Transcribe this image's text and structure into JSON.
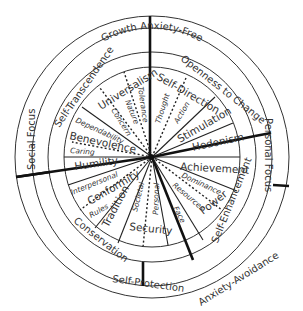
{
  "diagram": {
    "outer_ring": {
      "labels": [
        "Growth Anxiety-Free",
        "Self-Protection",
        "Anxiety-Avoidance"
      ]
    },
    "focus_ring": {
      "labels": [
        "Social Focus",
        "Personal Focus"
      ]
    },
    "higher_order_ring": {
      "labels": [
        "Self-Transcendence",
        "Openness to Change",
        "Self-Enhancement",
        "Conservation"
      ]
    },
    "values": [
      {
        "name": "Universalism",
        "subtypes": [
          "Concern",
          "Nature",
          "Tolerance"
        ]
      },
      {
        "name": "Self-Direction",
        "subtypes": [
          "Thought",
          "Action"
        ]
      },
      {
        "name": "Stimulation",
        "subtypes": []
      },
      {
        "name": "Hedonism",
        "subtypes": []
      },
      {
        "name": "Achievement",
        "subtypes": []
      },
      {
        "name": "Power",
        "subtypes": [
          "Dominance",
          "Resources"
        ]
      },
      {
        "name": "Face",
        "subtypes": []
      },
      {
        "name": "Security",
        "subtypes": [
          "Personal",
          "Societal"
        ]
      },
      {
        "name": "Tradition",
        "subtypes": []
      },
      {
        "name": "Conformity",
        "subtypes": [
          "Rules",
          "Interpersonal"
        ]
      },
      {
        "name": "Humility",
        "subtypes": []
      },
      {
        "name": "Benevolence",
        "subtypes": [
          "Caring",
          "Dependability"
        ]
      }
    ],
    "colors": {
      "line": "#222222",
      "text": "#333333",
      "background": "#ffffff"
    }
  }
}
